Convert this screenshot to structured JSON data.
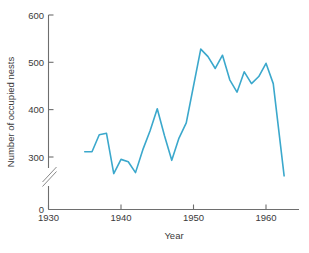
{
  "chart_data": {
    "type": "line",
    "title": "",
    "subtitle": "",
    "xlabel": "Year",
    "ylabel": "Number of occupied nests",
    "xlim": [
      1930,
      1963
    ],
    "ylim": [
      0,
      600
    ],
    "y_axis_break": true,
    "y_axis_break_note": "axis broken between 0 and ~270",
    "grid": false,
    "legend": null,
    "xticks": [
      1930,
      1940,
      1950,
      1960
    ],
    "xtick_labels": [
      "1930",
      "1940",
      "1950",
      "1960"
    ],
    "yticks": [
      0,
      300,
      400,
      500,
      600
    ],
    "ytick_labels": [
      "0",
      "300",
      "400",
      "500",
      "600"
    ],
    "line_color": "#3ba8cc",
    "line_width": 1.6,
    "series": [
      {
        "name": "Number of occupied nests",
        "x": [
          1935,
          1936,
          1937,
          1938,
          1939,
          1940,
          1941,
          1942,
          1943,
          1944,
          1945,
          1946,
          1947,
          1948,
          1949,
          1950,
          1951,
          1952,
          1953,
          1954,
          1955,
          1956,
          1957,
          1958,
          1959,
          1960,
          1961,
          1962.5
        ],
        "values": [
          311,
          311,
          347,
          350,
          265,
          295,
          290,
          267,
          315,
          355,
          402,
          345,
          293,
          340,
          372,
          450,
          528,
          512,
          487,
          515,
          463,
          437,
          480,
          455,
          470,
          498,
          455,
          260
        ]
      }
    ],
    "annotations": []
  },
  "axes": {
    "x_title": "Year",
    "y_title": "Number of occupied nests"
  }
}
